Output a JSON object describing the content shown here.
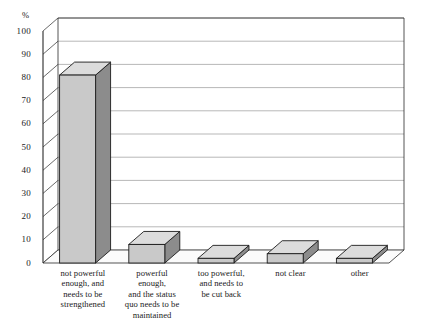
{
  "chart_data": {
    "type": "bar",
    "title": "",
    "subtitle": "",
    "xlabel": "",
    "ylabel": "%",
    "ylim": [
      0,
      100
    ],
    "ytick_step": 10,
    "grid": true,
    "legend": "none",
    "style": "3d-bar",
    "categories": [
      "not powerful enough, and needs to be strengthened",
      "powerful enough, and the status quo needs to be maintained",
      "too powerful, and needs to be cut back",
      "not clear",
      "other"
    ],
    "values": [
      81,
      8,
      2,
      4,
      2
    ],
    "yticks": [
      "0",
      "10",
      "20",
      "30",
      "40",
      "50",
      "60",
      "70",
      "80",
      "90",
      "100"
    ],
    "colors": {
      "bar_front": "#c9c9c9",
      "bar_side": "#8c8c8c",
      "bar_top": "#dcdcdc",
      "bar_outline": "#1c1c1c",
      "grid": "#9a9a9a",
      "axis": "#2a2a2a",
      "floor": "#fbfbfb",
      "text": "#1a1a1a",
      "background": "#ffffff"
    }
  },
  "labels": {
    "unit": "%",
    "cat0_lines": [
      "not powerful",
      "enough, and",
      "needs to be",
      "strengthened"
    ],
    "cat1_lines": [
      "powerful",
      "enough,",
      "and the status",
      "quo needs to be",
      "maintained"
    ],
    "cat2_lines": [
      "too powerful,",
      "and needs to",
      "be cut back"
    ],
    "cat3_lines": [
      "not clear"
    ],
    "cat4_lines": [
      "other"
    ]
  }
}
